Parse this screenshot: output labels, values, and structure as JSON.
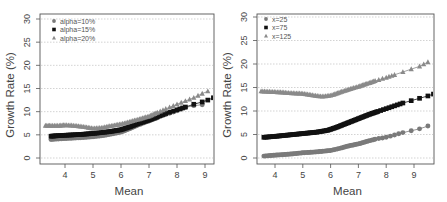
{
  "chart_data": [
    {
      "type": "scatter",
      "panel": "left",
      "title": "",
      "xlabel": "Mean",
      "ylabel": "Growth Rate (%)",
      "xlim": [
        3.3,
        9.4
      ],
      "ylim": [
        -1,
        31
      ],
      "xticks": [
        4,
        5,
        6,
        7,
        8,
        9
      ],
      "yticks": [
        0,
        5,
        10,
        15,
        20,
        25,
        30
      ],
      "grid": "horizontal dotted",
      "legend_position": "top-left",
      "series": [
        {
          "name": "alpha=10%",
          "marker": "circle",
          "color": "#7a7a7a",
          "x": [
            3.5,
            3.7,
            4.0,
            4.3,
            4.6,
            5.0,
            5.3,
            5.6,
            6.0,
            6.3,
            6.6,
            7.0,
            7.3,
            7.6,
            8.0,
            8.3,
            8.6,
            8.9
          ],
          "y": [
            4.0,
            4.1,
            4.2,
            4.3,
            4.4,
            4.6,
            4.8,
            5.1,
            5.6,
            6.3,
            7.1,
            8.0,
            8.7,
            9.4,
            10.2,
            10.9,
            11.3,
            11.5
          ]
        },
        {
          "name": "alpha=15%",
          "marker": "square",
          "color": "#111111",
          "x": [
            3.5,
            3.7,
            4.0,
            4.3,
            4.6,
            5.0,
            5.3,
            5.6,
            6.0,
            6.3,
            6.6,
            7.0,
            7.3,
            7.6,
            8.0,
            8.3,
            8.6,
            8.9,
            9.1,
            9.3
          ],
          "y": [
            4.7,
            4.8,
            4.9,
            5.0,
            5.1,
            5.3,
            5.5,
            5.7,
            6.1,
            6.7,
            7.4,
            8.2,
            8.9,
            9.6,
            10.4,
            11.0,
            11.6,
            12.1,
            12.5,
            13.0
          ]
        },
        {
          "name": "alpha=20%",
          "marker": "triangle",
          "color": "#8a8a8a",
          "x": [
            3.3,
            3.5,
            3.8,
            4.0,
            4.3,
            4.6,
            5.0,
            5.3,
            5.6,
            6.0,
            6.3,
            6.6,
            7.0,
            7.3,
            7.6,
            8.0,
            8.3,
            8.6,
            8.9,
            9.1
          ],
          "y": [
            7.0,
            7.0,
            7.0,
            7.1,
            7.0,
            6.8,
            6.4,
            6.5,
            6.9,
            7.3,
            7.8,
            8.3,
            9.0,
            9.8,
            10.6,
            11.6,
            12.3,
            13.0,
            13.9,
            14.4
          ]
        }
      ]
    },
    {
      "type": "scatter",
      "panel": "right",
      "title": "",
      "xlabel": "Mean",
      "ylabel": "Growth Rate (%)",
      "xlim": [
        3.4,
        9.7
      ],
      "ylim": [
        -1,
        31
      ],
      "xticks": [
        4,
        5,
        6,
        7,
        8,
        9
      ],
      "yticks": [
        0,
        5,
        10,
        15,
        20,
        25,
        30
      ],
      "grid": "horizontal dotted",
      "legend_position": "top-left",
      "series": [
        {
          "name": "x=25",
          "marker": "circle",
          "color": "#7a7a7a",
          "x": [
            3.6,
            4.0,
            4.5,
            5.0,
            5.5,
            6.0,
            6.3,
            6.6,
            7.0,
            7.3,
            7.6,
            8.0,
            8.3,
            8.6,
            8.9,
            9.2,
            9.5
          ],
          "y": [
            0.4,
            0.6,
            0.8,
            1.1,
            1.3,
            1.6,
            2.0,
            2.5,
            3.0,
            3.5,
            4.0,
            4.4,
            4.9,
            5.4,
            5.8,
            6.2,
            6.8
          ]
        },
        {
          "name": "x=75",
          "marker": "square",
          "color": "#111111",
          "x": [
            3.6,
            4.0,
            4.5,
            5.0,
            5.5,
            5.9,
            6.2,
            6.5,
            6.8,
            7.1,
            7.4,
            7.7,
            8.0,
            8.3,
            8.6,
            8.9,
            9.2,
            9.5,
            9.7
          ],
          "y": [
            4.4,
            4.6,
            4.9,
            5.2,
            5.5,
            5.9,
            6.5,
            7.2,
            7.9,
            8.6,
            9.3,
            9.9,
            10.5,
            11.1,
            11.7,
            12.2,
            12.7,
            13.2,
            13.6
          ]
        },
        {
          "name": "x=125",
          "marker": "triangle",
          "color": "#8a8a8a",
          "x": [
            3.5,
            3.8,
            4.2,
            4.6,
            5.0,
            5.4,
            5.7,
            6.0,
            6.3,
            6.6,
            7.0,
            7.3,
            7.6,
            8.0,
            8.3,
            8.6,
            8.9,
            9.2,
            9.5
          ],
          "y": [
            14.2,
            14.1,
            14.0,
            13.8,
            13.7,
            13.3,
            13.1,
            13.3,
            13.9,
            14.5,
            15.2,
            15.8,
            16.4,
            17.1,
            17.7,
            18.3,
            18.9,
            19.5,
            20.4
          ]
        }
      ]
    }
  ]
}
